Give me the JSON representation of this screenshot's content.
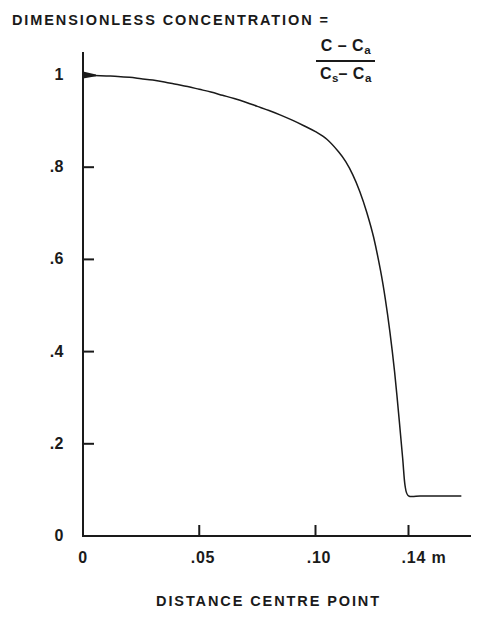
{
  "title": {
    "main": "DIMENSIONLESS CONCENTRATION =",
    "formula_numerator_c": "C",
    "formula_numerator_minus": "–",
    "formula_numerator_ca": "C",
    "formula_numerator_ca_sub": "a",
    "formula_denominator_cs": "C",
    "formula_denominator_cs_sub": "s",
    "formula_denominator_minus": "–",
    "formula_denominator_ca": "C",
    "formula_denominator_ca_sub": "a"
  },
  "axes": {
    "x_title": "DISTANCE CENTRE POINT",
    "y_tick_labels": [
      "1",
      ".8",
      ".6",
      ".4",
      ".2",
      "0"
    ],
    "x_tick_labels": [
      "0",
      ".05",
      ".10",
      ".14 m"
    ]
  },
  "chart_data": {
    "type": "line",
    "xlabel": "DISTANCE CENTRE POINT",
    "ylabel": "DIMENSIONLESS CONCENTRATION",
    "xlim": [
      0,
      0.1625
    ],
    "ylim": [
      0,
      1.04
    ],
    "x_ticks": [
      0,
      0.05,
      0.1,
      0.14
    ],
    "x_tick_labels": [
      "0",
      ".05",
      ".10",
      ".14 m"
    ],
    "y_ticks": [
      0,
      0.2,
      0.4,
      0.6,
      0.8,
      1.0
    ],
    "y_tick_labels": [
      "0",
      ".2",
      ".4",
      ".6",
      ".8",
      "1"
    ],
    "x_units": "m",
    "grid": false,
    "legend": null,
    "line_color": "#1a1a1a",
    "line_width": 1.5,
    "series": [
      {
        "name": "concentration profile",
        "x": [
          0.0,
          0.005,
          0.01,
          0.015,
          0.02,
          0.025,
          0.03,
          0.035,
          0.04,
          0.045,
          0.05,
          0.055,
          0.06,
          0.065,
          0.07,
          0.075,
          0.08,
          0.085,
          0.09,
          0.095,
          0.1,
          0.105,
          0.11,
          0.113,
          0.116,
          0.119,
          0.122,
          0.125,
          0.128,
          0.13,
          0.132,
          0.134,
          0.136,
          0.1375,
          0.1385,
          0.14,
          0.145,
          0.15,
          0.155,
          0.16,
          0.1625
        ],
        "y": [
          1.0,
          0.999,
          0.998,
          0.997,
          0.995,
          0.992,
          0.989,
          0.985,
          0.98,
          0.975,
          0.969,
          0.963,
          0.956,
          0.949,
          0.941,
          0.932,
          0.923,
          0.913,
          0.902,
          0.89,
          0.877,
          0.86,
          0.833,
          0.812,
          0.784,
          0.748,
          0.703,
          0.648,
          0.575,
          0.515,
          0.443,
          0.357,
          0.252,
          0.168,
          0.11,
          0.087,
          0.087,
          0.087,
          0.087,
          0.087,
          0.087
        ]
      }
    ],
    "annotations": [
      {
        "text": "plateau value",
        "value": 0.087,
        "x_from": 0.14,
        "x_to": 0.1625
      }
    ]
  },
  "geometry": {
    "origin_x": 83,
    "origin_y": 536,
    "x_pixels_per_unit": 2325,
    "y_pixels_per_unit": 461,
    "axis_top_y": 53,
    "axis_right_x": 470
  }
}
